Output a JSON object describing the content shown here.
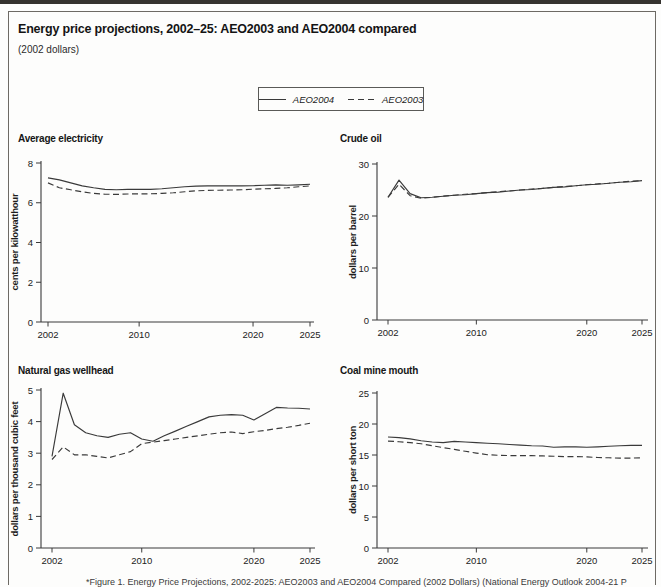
{
  "page": {
    "title": "Energy price projections, 2002–25: AEO2003 and AEO2004 compared",
    "subtitle": "(2002 dollars)",
    "caption": "*Figure 1. Energy Price Projections, 2002-2025: AEO2003 and AEO2004 Compared (2002 Dollars) (National Energy Outlook 2004-21 P"
  },
  "legend": {
    "items": [
      {
        "label": "AEO2004",
        "style": "solid"
      },
      {
        "label": "AEO2003",
        "style": "dashed"
      }
    ]
  },
  "colors": {
    "line": "#3a3a3a",
    "axis": "#3a3a3a",
    "text": "#222222"
  },
  "chart_data": [
    {
      "type": "line",
      "title": "Average electricity",
      "ylabel": "cents per kilowatthour",
      "ylim": [
        0,
        8
      ],
      "yticks": [
        0,
        2,
        4,
        6,
        8
      ],
      "xlim": [
        2002,
        2025
      ],
      "xticks": [
        2002,
        2010,
        2020,
        2025
      ],
      "x": [
        2002,
        2003,
        2004,
        2005,
        2006,
        2007,
        2008,
        2009,
        2010,
        2011,
        2012,
        2013,
        2014,
        2015,
        2016,
        2017,
        2018,
        2019,
        2020,
        2021,
        2022,
        2023,
        2024,
        2025
      ],
      "series": [
        {
          "name": "AEO2004",
          "line": "solid",
          "values": [
            7.25,
            7.15,
            7.0,
            6.85,
            6.75,
            6.67,
            6.65,
            6.67,
            6.67,
            6.67,
            6.7,
            6.75,
            6.8,
            6.84,
            6.85,
            6.85,
            6.85,
            6.85,
            6.86,
            6.88,
            6.9,
            6.88,
            6.9,
            6.93
          ]
        },
        {
          "name": "AEO2003",
          "line": "dashed",
          "values": [
            7.0,
            6.75,
            6.65,
            6.55,
            6.47,
            6.43,
            6.42,
            6.44,
            6.45,
            6.45,
            6.47,
            6.5,
            6.55,
            6.6,
            6.62,
            6.63,
            6.64,
            6.65,
            6.68,
            6.7,
            6.72,
            6.75,
            6.8,
            6.85
          ]
        }
      ]
    },
    {
      "type": "line",
      "title": "Crude oil",
      "ylabel": "dollars per barrel",
      "ylim": [
        0,
        30
      ],
      "yticks": [
        0,
        10,
        20,
        30
      ],
      "xlim": [
        2002,
        2025
      ],
      "xticks": [
        2002,
        2010,
        2020,
        2025
      ],
      "x": [
        2002,
        2003,
        2004,
        2005,
        2006,
        2007,
        2008,
        2009,
        2010,
        2011,
        2012,
        2013,
        2014,
        2015,
        2016,
        2017,
        2018,
        2019,
        2020,
        2021,
        2022,
        2023,
        2024,
        2025
      ],
      "series": [
        {
          "name": "AEO2004",
          "line": "solid",
          "values": [
            23.6,
            26.9,
            24.3,
            23.5,
            23.6,
            23.8,
            24.0,
            24.1,
            24.3,
            24.5,
            24.6,
            24.8,
            25.0,
            25.1,
            25.3,
            25.5,
            25.6,
            25.8,
            26.0,
            26.1,
            26.3,
            26.5,
            26.6,
            26.8
          ]
        },
        {
          "name": "AEO2003",
          "line": "dashed",
          "values": [
            23.6,
            26.1,
            23.9,
            23.4,
            23.6,
            23.8,
            24.0,
            24.2,
            24.3,
            24.5,
            24.7,
            24.8,
            25.0,
            25.2,
            25.3,
            25.5,
            25.7,
            25.8,
            26.0,
            26.2,
            26.3,
            26.5,
            26.7,
            26.8
          ]
        }
      ]
    },
    {
      "type": "line",
      "title": "Natural gas wellhead",
      "ylabel": "dollars per thousand cubic feet",
      "ylim": [
        0,
        5
      ],
      "yticks": [
        0,
        1,
        2,
        3,
        4,
        5
      ],
      "xlim": [
        2002,
        2025
      ],
      "xticks": [
        2002,
        2010,
        2020,
        2025
      ],
      "x": [
        2002,
        2003,
        2004,
        2005,
        2006,
        2007,
        2008,
        2009,
        2010,
        2011,
        2012,
        2013,
        2014,
        2015,
        2016,
        2017,
        2018,
        2019,
        2020,
        2021,
        2022,
        2023,
        2024,
        2025
      ],
      "series": [
        {
          "name": "AEO2004",
          "line": "solid",
          "values": [
            2.9,
            4.9,
            3.9,
            3.65,
            3.55,
            3.5,
            3.6,
            3.65,
            3.45,
            3.38,
            3.55,
            3.7,
            3.85,
            4.0,
            4.15,
            4.2,
            4.22,
            4.2,
            4.05,
            4.25,
            4.45,
            4.43,
            4.42,
            4.4
          ]
        },
        {
          "name": "AEO2003",
          "line": "dashed",
          "values": [
            2.8,
            3.2,
            2.95,
            2.95,
            2.9,
            2.85,
            2.95,
            3.05,
            3.3,
            3.35,
            3.4,
            3.45,
            3.5,
            3.55,
            3.6,
            3.65,
            3.67,
            3.62,
            3.68,
            3.72,
            3.78,
            3.82,
            3.88,
            3.95
          ]
        }
      ]
    },
    {
      "type": "line",
      "title": "Coal mine mouth",
      "ylabel": "dollars per short ton",
      "ylim": [
        0,
        25
      ],
      "yticks": [
        0,
        5,
        10,
        15,
        20,
        25
      ],
      "xlim": [
        2002,
        2025
      ],
      "xticks": [
        2002,
        2010,
        2020,
        2025
      ],
      "x": [
        2002,
        2003,
        2004,
        2005,
        2006,
        2007,
        2008,
        2009,
        2010,
        2011,
        2012,
        2013,
        2014,
        2015,
        2016,
        2017,
        2018,
        2019,
        2020,
        2021,
        2022,
        2023,
        2024,
        2025
      ],
      "series": [
        {
          "name": "AEO2004",
          "line": "solid",
          "values": [
            17.9,
            17.8,
            17.6,
            17.3,
            17.1,
            17.0,
            17.2,
            17.1,
            17.0,
            16.9,
            16.8,
            16.7,
            16.6,
            16.5,
            16.45,
            16.25,
            16.3,
            16.3,
            16.25,
            16.3,
            16.4,
            16.5,
            16.55,
            16.55
          ]
        },
        {
          "name": "AEO2003",
          "line": "dashed",
          "values": [
            17.25,
            17.15,
            17.0,
            16.8,
            16.5,
            16.2,
            15.9,
            15.6,
            15.3,
            15.05,
            14.95,
            14.9,
            14.9,
            14.9,
            14.85,
            14.8,
            14.75,
            14.75,
            14.7,
            14.6,
            14.55,
            14.5,
            14.5,
            14.55
          ]
        }
      ]
    }
  ]
}
